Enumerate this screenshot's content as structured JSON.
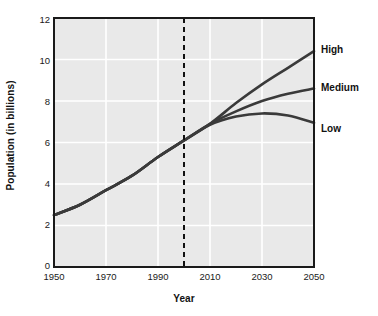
{
  "chart_data": {
    "type": "line",
    "title": "",
    "xlabel": "Year",
    "ylabel": "Population (in billions)",
    "xlim": [
      1950,
      2050
    ],
    "ylim": [
      0,
      12
    ],
    "xticks": [
      1950,
      1970,
      1990,
      2010,
      2030,
      2050
    ],
    "yticks": [
      0,
      2,
      4,
      6,
      8,
      10,
      12
    ],
    "grid": true,
    "legend_position": "right-of-plot-inline",
    "annotations": [
      {
        "name": "projection-divider",
        "type": "vertical-dashed-line",
        "x": 2000
      }
    ],
    "x": [
      1950,
      1960,
      1970,
      1980,
      1990,
      2000,
      2010,
      2020,
      2030,
      2040,
      2050
    ],
    "series": [
      {
        "name": "High",
        "color": "#3a3a3a",
        "values": [
          2.5,
          3.0,
          3.7,
          4.4,
          5.3,
          6.1,
          6.9,
          7.9,
          8.8,
          9.6,
          10.4
        ]
      },
      {
        "name": "Medium",
        "color": "#3a3a3a",
        "values": [
          2.5,
          3.0,
          3.7,
          4.4,
          5.3,
          6.1,
          6.9,
          7.5,
          8.0,
          8.35,
          8.6
        ]
      },
      {
        "name": "Low",
        "color": "#3a3a3a",
        "values": [
          2.5,
          3.0,
          3.7,
          4.4,
          5.3,
          6.1,
          6.85,
          7.25,
          7.4,
          7.3,
          6.95
        ]
      }
    ]
  },
  "labels": {
    "high": "High",
    "medium": "Medium",
    "low": "Low"
  },
  "ticks": {
    "y": [
      "12",
      "10",
      "8",
      "6",
      "4",
      "2",
      "0"
    ],
    "x": [
      "1950",
      "1970",
      "1990",
      "2010",
      "2030",
      "2050"
    ]
  },
  "axis_titles": {
    "x": "Year",
    "y": "Population (in billions)"
  },
  "colors": {
    "plot_background": "#e9e9e9",
    "gridline": "#ffffff",
    "axis": "#1a1a1a",
    "line": "#3f3f3f",
    "text": "#111111"
  }
}
